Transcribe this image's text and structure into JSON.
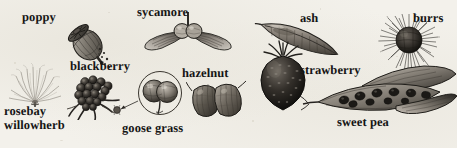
{
  "figure": {
    "style": "pen-and-ink grayscale botanical plate",
    "background_color": "#f3f1eb",
    "ink_color": "#151515"
  },
  "labels": {
    "poppy": "poppy",
    "sycamore": "sycamore",
    "ash": "ash",
    "burrs": "burrs",
    "blackberry": "blackberry",
    "hazelnut": "hazelnut",
    "strawberry": "strawberry",
    "rosebay_line1": "rosebay",
    "rosebay_line2": "willowherb",
    "goose_grass": "goose grass",
    "sweet_pea": "sweet pea"
  },
  "specimens": [
    {
      "name": "poppy",
      "label": "poppy",
      "description": "poppy seed capsule shedding seeds"
    },
    {
      "name": "rosebay-willowherb",
      "label": "rosebay willowherb",
      "description": "fluffy plumed seed head"
    },
    {
      "name": "blackberry",
      "label": "blackberry",
      "description": "cluster of dark drupelets"
    },
    {
      "name": "sycamore",
      "label": "sycamore",
      "description": "paired winged samara"
    },
    {
      "name": "goose-grass",
      "label": "goose grass",
      "description": "magnified hooked burr fruit"
    },
    {
      "name": "hazelnut",
      "label": "hazelnut",
      "description": "pair of hazelnuts in husk"
    },
    {
      "name": "ash",
      "label": "ash",
      "description": "single winged ash key"
    },
    {
      "name": "strawberry",
      "label": "strawberry",
      "description": "strawberry fruit with calyx"
    },
    {
      "name": "burrs",
      "label": "burrs",
      "description": "spiny burdock burr"
    },
    {
      "name": "sweet-pea",
      "label": "sweet pea",
      "description": "split pea pod with seeds"
    }
  ]
}
